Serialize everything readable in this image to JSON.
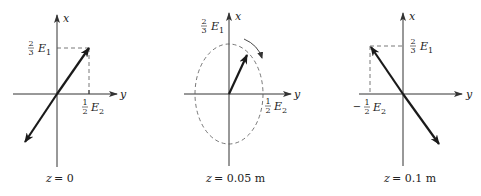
{
  "panels": [
    {
      "id": "z0",
      "caption_var": "z",
      "caption_value": "= 0",
      "x_axis_label": "x",
      "y_axis_label": "y",
      "x_tick": {
        "num": "2",
        "den": "3",
        "sym": "E",
        "sub": "1"
      },
      "y_tick": {
        "sign": "",
        "num": "1",
        "den": "2",
        "sym": "E",
        "sub": "2"
      }
    },
    {
      "id": "z005",
      "caption_var": "z",
      "caption_value": "= 0.05 m",
      "x_axis_label": "x",
      "y_axis_label": "y",
      "x_tick": {
        "num": "2",
        "den": "3",
        "sym": "E",
        "sub": "1"
      },
      "y_tick": {
        "sign": "",
        "num": "1",
        "den": "2",
        "sym": "E",
        "sub": "2"
      }
    },
    {
      "id": "z01",
      "caption_var": "z",
      "caption_value": "= 0.1 m",
      "x_axis_label": "x",
      "y_axis_label": "y",
      "x_tick": {
        "num": "2",
        "den": "3",
        "sym": "E",
        "sub": "1"
      },
      "y_tick": {
        "sign": "−",
        "num": "1",
        "den": "2",
        "sym": "E",
        "sub": "2"
      }
    }
  ]
}
